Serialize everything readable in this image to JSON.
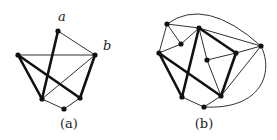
{
  "figures": [
    {
      "id": "a",
      "caption": "(a)",
      "caption_pos": [
        69,
        128
      ],
      "node_labels": [
        {
          "text": "a",
          "x": 62,
          "y": 21
        },
        {
          "text": "b",
          "x": 103,
          "y": 50
        }
      ],
      "nodes": [
        {
          "id": "top",
          "x": 58,
          "y": 31
        },
        {
          "id": "left",
          "x": 18,
          "y": 55
        },
        {
          "id": "b",
          "x": 95,
          "y": 55
        },
        {
          "id": "bl",
          "x": 42,
          "y": 99
        },
        {
          "id": "br",
          "x": 80,
          "y": 98
        },
        {
          "id": "bottom",
          "x": 64,
          "y": 109
        }
      ],
      "edges": [
        {
          "from": "top",
          "to": "bl",
          "weight": "thick"
        },
        {
          "from": "top",
          "to": "b",
          "weight": "thin"
        },
        {
          "from": "left",
          "to": "b",
          "weight": "thin"
        },
        {
          "from": "left",
          "to": "bl",
          "weight": "thick"
        },
        {
          "from": "left",
          "to": "br",
          "weight": "thick"
        },
        {
          "from": "b",
          "to": "br",
          "weight": "thick"
        },
        {
          "from": "b",
          "to": "bl",
          "weight": "thin"
        },
        {
          "from": "bl",
          "to": "bottom",
          "weight": "thin"
        },
        {
          "from": "bottom",
          "to": "br",
          "weight": "thin"
        }
      ]
    },
    {
      "id": "b",
      "caption": "(b)",
      "caption_pos": [
        204,
        128
      ],
      "nodes": [
        {
          "id": "n1",
          "x": 167,
          "y": 24
        },
        {
          "id": "n2",
          "x": 199,
          "y": 28
        },
        {
          "id": "n3",
          "x": 181,
          "y": 44
        },
        {
          "id": "n4",
          "x": 159,
          "y": 53
        },
        {
          "id": "n5",
          "x": 261,
          "y": 46
        },
        {
          "id": "n6",
          "x": 236,
          "y": 53
        },
        {
          "id": "n7",
          "x": 207,
          "y": 60
        },
        {
          "id": "n8",
          "x": 182,
          "y": 97
        },
        {
          "id": "n9",
          "x": 221,
          "y": 96
        },
        {
          "id": "n10",
          "x": 204,
          "y": 107
        }
      ],
      "edges": [
        {
          "from": "n1",
          "to": "n2",
          "weight": "thin"
        },
        {
          "from": "n1",
          "to": "n3",
          "weight": "thin"
        },
        {
          "from": "n1",
          "to": "n4",
          "weight": "thin"
        },
        {
          "from": "n3",
          "to": "n2",
          "weight": "thin"
        },
        {
          "from": "n3",
          "to": "n4",
          "weight": "thin"
        },
        {
          "from": "n4",
          "to": "n8",
          "weight": "thick"
        },
        {
          "from": "n4",
          "to": "n9",
          "weight": "thick"
        },
        {
          "from": "n2",
          "to": "n8",
          "weight": "thick"
        },
        {
          "from": "n2",
          "to": "n6",
          "weight": "thick"
        },
        {
          "from": "n2",
          "to": "n5",
          "weight": "thin"
        },
        {
          "from": "n2",
          "to": "n7",
          "weight": "thin"
        },
        {
          "from": "n7",
          "to": "n6",
          "weight": "thin"
        },
        {
          "from": "n7",
          "to": "n9",
          "weight": "thin"
        },
        {
          "from": "n6",
          "to": "n5",
          "weight": "thin"
        },
        {
          "from": "n6",
          "to": "n9",
          "weight": "thick"
        },
        {
          "from": "n9",
          "to": "n5",
          "weight": "thin"
        },
        {
          "from": "n8",
          "to": "n10",
          "weight": "thin"
        },
        {
          "from": "n10",
          "to": "n9",
          "weight": "thin"
        }
      ],
      "arcs": [
        {
          "from": "n1",
          "to": "n5",
          "path": "M167,24 Q205,-4 261,46"
        },
        {
          "from": "n5",
          "to": "n10",
          "path": "M261,46 C274,72 262,110 204,107"
        }
      ]
    }
  ],
  "colors": {
    "stroke": "#111111",
    "background": "#ffffff"
  }
}
